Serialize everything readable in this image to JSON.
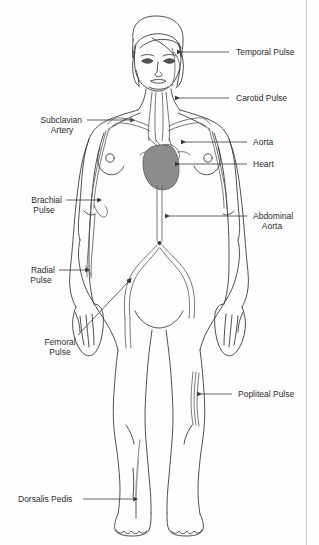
{
  "figure": {
    "width": 319,
    "height": 545,
    "background_color": "#fefefe",
    "outline_color": "#3c3c3c",
    "vessel_color": "#555555",
    "heart_fill_color": "#8d8d8d",
    "label_text_color": "#2b2b2b",
    "leader_line_color": "#444444",
    "label_font_size_px": 8.5
  },
  "labels": [
    {
      "id": "temporal-pulse",
      "lines": [
        "Temporal Pulse"
      ],
      "side": "right",
      "text_x": 236,
      "text_y": 55,
      "leader": {
        "x1": 229,
        "y1": 52,
        "x2": 177,
        "y2": 52
      },
      "arrow": "left",
      "target": "temple (superficial temporal artery)"
    },
    {
      "id": "carotid-pulse",
      "lines": [
        "Carotid Pulse"
      ],
      "side": "right",
      "text_x": 236,
      "text_y": 100,
      "leader": {
        "x1": 229,
        "y1": 98,
        "x2": 175,
        "y2": 98
      },
      "arrow": "left",
      "target": "neck (common carotid artery)"
    },
    {
      "id": "aorta",
      "lines": [
        "Aorta"
      ],
      "side": "right",
      "text_x": 253,
      "text_y": 144,
      "leader": {
        "x1": 247,
        "y1": 142,
        "x2": 181,
        "y2": 142
      },
      "arrow": "left",
      "target": "aortic arch"
    },
    {
      "id": "heart",
      "lines": [
        "Heart"
      ],
      "side": "right",
      "text_x": 253,
      "text_y": 166,
      "leader": {
        "x1": 247,
        "y1": 164,
        "x2": 175,
        "y2": 164
      },
      "arrow": "left",
      "target": "heart"
    },
    {
      "id": "abdominal-aorta",
      "lines": [
        "Abdominal",
        "Aorta"
      ],
      "side": "right",
      "text_x": 253,
      "text_y": 218,
      "leader": {
        "x1": 247,
        "y1": 216,
        "x2": 165,
        "y2": 216
      },
      "arrow": "left",
      "target": "abdominal aorta"
    },
    {
      "id": "popliteal-pulse",
      "lines": [
        "Popliteal Pulse"
      ],
      "side": "right",
      "text_x": 238,
      "text_y": 396,
      "leader": {
        "x1": 232,
        "y1": 394,
        "x2": 197,
        "y2": 394
      },
      "arrow": "left",
      "target": "behind knee (popliteal artery)"
    },
    {
      "id": "subclavian-artery",
      "lines": [
        "Subclavian",
        "Artery"
      ],
      "side": "left",
      "text_x": 82,
      "text_y": 122,
      "leader": {
        "x1": 87,
        "y1": 120,
        "x2": 131,
        "y2": 120
      },
      "arrow": "right",
      "target": "subclavian artery"
    },
    {
      "id": "brachial-pulse",
      "lines": [
        "Brachial",
        "Pulse"
      ],
      "side": "left",
      "text_x": 62,
      "text_y": 202,
      "leader": {
        "x1": 66,
        "y1": 200,
        "x2": 98,
        "y2": 200
      },
      "arrow": "right",
      "target": "inner elbow (brachial artery)"
    },
    {
      "id": "radial-pulse",
      "lines": [
        "Radial",
        "Pulse"
      ],
      "side": "left",
      "text_x": 55,
      "text_y": 272,
      "leader": {
        "x1": 59,
        "y1": 270,
        "x2": 86,
        "y2": 270
      },
      "arrow": "right",
      "target": "wrist (radial artery)"
    },
    {
      "id": "femoral-pulse",
      "lines": [
        "Femoral",
        "Pulse"
      ],
      "side": "left",
      "text_x": 60,
      "text_y": 342,
      "leader": {
        "x1": 78,
        "y1": 335,
        "x2": 129,
        "y2": 280
      },
      "arrow": "diagonal-up-right",
      "target": "groin (femoral artery)"
    },
    {
      "id": "dorsalis-pedis",
      "lines": [
        "Dorsalis Pedis"
      ],
      "side": "left",
      "text_x": 18,
      "text_y": 501,
      "leader": {
        "x1": 83,
        "y1": 499,
        "x2": 134,
        "y2": 499
      },
      "arrow": "right",
      "target": "top of foot (dorsalis pedis artery)"
    }
  ]
}
